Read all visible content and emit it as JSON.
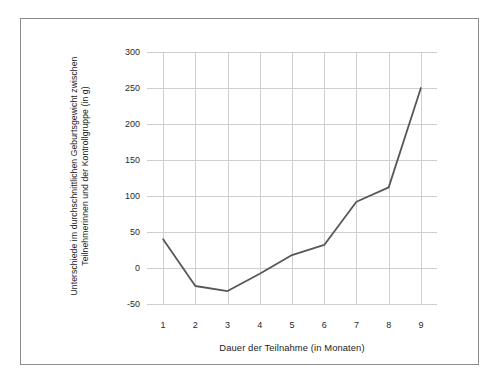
{
  "chart_data": {
    "type": "line",
    "title": "",
    "xlabel": "Dauer der Teilnahme (in Monaten)",
    "ylabel": "Unterschiede im durchschnittlichen Geburtsgewicht zwischen Teilnehmerinnen und der Kontrollgruppe (in g)",
    "ylabel_lines": [
      "Unterschiede im durchschnittlichen Geburtsgewicht zwischen",
      "Teilnehmerinnen und der Kontrollgruppe (in g)"
    ],
    "categories": [
      "1",
      "2",
      "3",
      "4",
      "5",
      "6",
      "7",
      "8",
      "9"
    ],
    "x": [
      1,
      2,
      3,
      4,
      5,
      6,
      7,
      8,
      9
    ],
    "values": [
      40,
      -25,
      -32,
      -8,
      18,
      32,
      92,
      112,
      250
    ],
    "series": [
      {
        "name": "Unterschied im Geburtsgewicht",
        "values": [
          40,
          -25,
          -32,
          -8,
          18,
          32,
          92,
          112,
          250
        ]
      }
    ],
    "ytick_labels": [
      "300",
      "250",
      "200",
      "150",
      "100",
      "50",
      "0",
      "-50"
    ],
    "ytick_values": [
      300,
      250,
      200,
      150,
      100,
      50,
      0,
      -50
    ],
    "xtick_labels": [
      "1",
      "2",
      "3",
      "4",
      "5",
      "6",
      "7",
      "8",
      "9"
    ],
    "ylim": [
      -50,
      300
    ],
    "xlim": [
      0.5,
      9.5
    ],
    "grid": true,
    "grid_axis": "both",
    "legend": false,
    "legend_position": "none",
    "colors": {
      "line": "#575757",
      "grid": "#cfcfcf",
      "frame": "#8d8d8d",
      "text": "#1c1c1c",
      "background": "#ffffff"
    },
    "line_width": 1.8,
    "markers": false
  }
}
